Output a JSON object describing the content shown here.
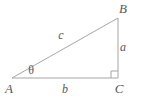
{
  "figure": {
    "background_color": "#ffffff",
    "line_color": "#a6a6a8",
    "label_color": "#58585a",
    "vertices": [
      {
        "name": "A",
        "label": "A",
        "x": 12,
        "y": 78,
        "label_x": 9,
        "label_y": 93
      },
      {
        "name": "B",
        "label": "B",
        "x": 118,
        "y": 18,
        "label_x": 123,
        "label_y": 13
      },
      {
        "name": "C",
        "label": "C",
        "x": 118,
        "y": 78,
        "label_x": 119,
        "label_y": 93
      }
    ],
    "sides": [
      {
        "name": "opposite",
        "label": "a",
        "label_x": 123,
        "label_y": 51
      },
      {
        "name": "adjacent",
        "label": "b",
        "label_x": 65,
        "label_y": 93
      },
      {
        "name": "hypotenuse",
        "label": "c",
        "label_x": 61,
        "label_y": 39
      }
    ],
    "angle": {
      "name": "theta",
      "label": "θ",
      "label_x": 31,
      "label_y": 74
    },
    "right_angle": {
      "label": "right-angle-marker",
      "at_vertex": "C",
      "size": 6
    }
  }
}
